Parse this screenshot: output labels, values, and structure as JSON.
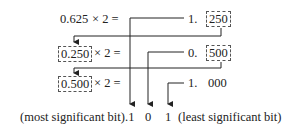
{
  "rows": [
    {
      "multiplicand": "0.625",
      "op": "× 2 =",
      "int_part": "1.",
      "frac_part": "250"
    },
    {
      "multiplicand": "0.250",
      "op": "× 2 =",
      "int_part": "0.",
      "frac_part": "500"
    },
    {
      "multiplicand": "0.500",
      "op": "× 2 =",
      "int_part": "1.",
      "frac_part": "000"
    }
  ],
  "result": {
    "msb_label": "(most significant bit)",
    "bits": [
      ".1",
      "0",
      "1"
    ],
    "lsb_label": "(least significant bit)"
  },
  "colors": {
    "line": "#222222",
    "box_border": "#555555"
  }
}
